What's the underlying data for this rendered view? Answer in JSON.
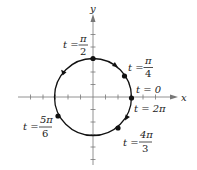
{
  "figure": {
    "type": "parametric-circle-diagram",
    "axes": {
      "x_label": "x",
      "y_label": "y",
      "x_ticks_each_side": 6,
      "y_ticks_each_side": 6
    },
    "curve": "circle",
    "orientation": "clockwise",
    "colors": {
      "stroke": "#111111",
      "axis": "#777777",
      "text": "#222222"
    },
    "points": [
      {
        "id": "p-pi-2",
        "t_prefix": "t =",
        "num": "π",
        "den": "2",
        "label": "t = π/2"
      },
      {
        "id": "p-pi-4",
        "t_prefix": "t =",
        "num": "π",
        "den": "4",
        "label": "t = π/4"
      },
      {
        "id": "p-0",
        "t_prefix": "t = 0",
        "label": "t = 0"
      },
      {
        "id": "p-2pi",
        "t_prefix": "t = 2π",
        "label": "t = 2π"
      },
      {
        "id": "p-5pi-6",
        "t_prefix": "t =",
        "num": "5π",
        "den": "6",
        "label": "t = 5π/6"
      },
      {
        "id": "p-4pi-3",
        "t_prefix": "t =",
        "num": "4π",
        "den": "3",
        "label": "t = 4π/3"
      }
    ]
  }
}
